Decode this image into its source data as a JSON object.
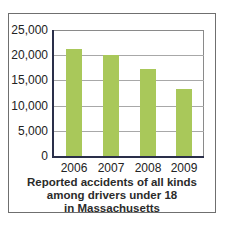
{
  "chart_data": {
    "type": "bar",
    "title": "",
    "caption": [
      "Reported accidents of all kinds",
      "among drivers under 18",
      "in Massachusetts"
    ],
    "categories": [
      "2006",
      "2007",
      "2008",
      "2009"
    ],
    "values": [
      21200,
      20000,
      17300,
      13300
    ],
    "xlabel": "",
    "ylabel": "",
    "ylim": [
      0,
      25000
    ],
    "yticks": [
      0,
      5000,
      10000,
      15000,
      20000,
      25000
    ],
    "ytick_labels": [
      "0",
      "5,000",
      "10,000",
      "15,000",
      "20,000",
      "25,000"
    ],
    "grid": true,
    "legend": null,
    "bar_color": "#a9c85a"
  }
}
